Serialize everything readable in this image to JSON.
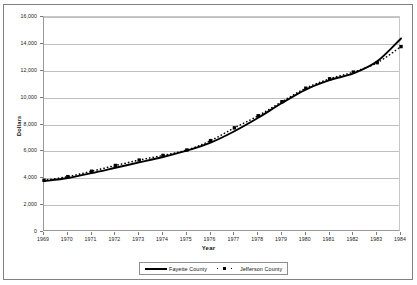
{
  "chart_data": {
    "type": "line",
    "title": "",
    "xlabel": "Year",
    "ylabel": "Dollars",
    "x": [
      1969,
      1970,
      1971,
      1972,
      1973,
      1974,
      1975,
      1976,
      1977,
      1978,
      1979,
      1980,
      1981,
      1982,
      1983,
      1984
    ],
    "categories": [
      "1969",
      "1970",
      "1971",
      "1972",
      "1973",
      "1974",
      "1975",
      "1976",
      "1977",
      "1978",
      "1979",
      "1980",
      "1981",
      "1982",
      "1983",
      "1984"
    ],
    "xlim": [
      1969,
      1984
    ],
    "ylim": [
      0,
      16000
    ],
    "yticks": [
      0,
      2000,
      4000,
      6000,
      8000,
      10000,
      12000,
      14000,
      16000
    ],
    "ytick_labels": [
      "0",
      "2,000",
      "4,000",
      "6,000",
      "8,000",
      "10,000",
      "12,000",
      "14,000",
      "16,000"
    ],
    "grid": "horizontal",
    "legend_position": "bottom",
    "series": [
      {
        "name": "Fayette County",
        "style": "solid",
        "color": "#000000",
        "marker": "none",
        "values": [
          3780,
          4020,
          4380,
          4780,
          5180,
          5580,
          6050,
          6650,
          7500,
          8500,
          9600,
          10600,
          11300,
          11800,
          12700,
          14400
        ]
      },
      {
        "name": "Jefferson County",
        "style": "dotted",
        "color": "#000000",
        "marker": "square",
        "values": [
          3850,
          4120,
          4520,
          4950,
          5350,
          5700,
          6100,
          6800,
          7750,
          8650,
          9700,
          10700,
          11400,
          11900,
          12600,
          13800
        ]
      }
    ]
  },
  "legend": {
    "entries": [
      {
        "label": "Fayette County"
      },
      {
        "label": "Jefferson County"
      }
    ]
  },
  "axes": {
    "x_title": "Year",
    "y_title": "Dollars"
  }
}
